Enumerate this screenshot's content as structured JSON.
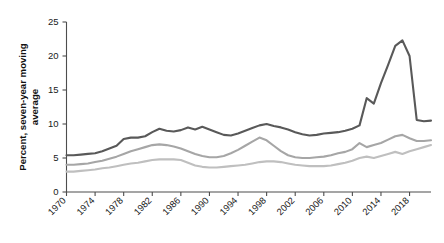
{
  "chart_data": {
    "type": "line",
    "title": "",
    "xlabel": "",
    "ylabel": "Percent, seven-year moving average",
    "ylabel_line1": "Percent, seven-year moving",
    "ylabel_line2": "average",
    "xlim": [
      1970,
      2021
    ],
    "ylim": [
      0,
      25
    ],
    "yticks": [
      0,
      5,
      10,
      15,
      20,
      25
    ],
    "ytick_labels": [
      "0",
      "5",
      "10",
      "15",
      "20",
      "25"
    ],
    "xticks": [
      1970,
      1974,
      1978,
      1982,
      1986,
      1990,
      1994,
      1998,
      2002,
      2006,
      2010,
      2014,
      2018
    ],
    "xtick_labels": [
      "1970",
      "1974",
      "1978",
      "1982",
      "1986",
      "1990",
      "1994",
      "1998",
      "2002",
      "2006",
      "2010",
      "2014",
      "2018"
    ],
    "grid": false,
    "legend": "none",
    "x": [
      1970,
      1971,
      1972,
      1973,
      1974,
      1975,
      1976,
      1977,
      1978,
      1979,
      1980,
      1981,
      1982,
      1983,
      1984,
      1985,
      1986,
      1987,
      1988,
      1989,
      1990,
      1991,
      1992,
      1993,
      1994,
      1995,
      1996,
      1997,
      1998,
      1999,
      2000,
      2001,
      2002,
      2003,
      2004,
      2005,
      2006,
      2007,
      2008,
      2009,
      2010,
      2011,
      2012,
      2013,
      2014,
      2015,
      2016,
      2017,
      2018,
      2019,
      2020,
      2021
    ],
    "series": [
      {
        "name": "series-dark",
        "color": "#595959",
        "width": 2.1,
        "values": [
          5.4,
          5.4,
          5.5,
          5.6,
          5.7,
          6.0,
          6.4,
          6.8,
          7.8,
          8.0,
          8.0,
          8.2,
          8.8,
          9.3,
          9.0,
          8.9,
          9.1,
          9.5,
          9.2,
          9.6,
          9.2,
          8.8,
          8.4,
          8.3,
          8.6,
          9.0,
          9.4,
          9.8,
          10.0,
          9.7,
          9.5,
          9.2,
          8.8,
          8.5,
          8.3,
          8.4,
          8.6,
          8.7,
          8.8,
          9.0,
          9.3,
          9.8,
          13.8,
          13.0,
          16.0,
          18.7,
          21.5,
          22.3,
          20.0,
          10.6,
          10.4,
          10.5
        ]
      },
      {
        "name": "series-medium",
        "color": "#a6a6a6",
        "width": 2.1,
        "values": [
          4.0,
          4.0,
          4.1,
          4.2,
          4.4,
          4.6,
          4.9,
          5.2,
          5.6,
          6.0,
          6.3,
          6.6,
          6.9,
          7.0,
          6.9,
          6.7,
          6.4,
          6.0,
          5.6,
          5.3,
          5.1,
          5.1,
          5.3,
          5.7,
          6.2,
          6.8,
          7.4,
          8.0,
          7.6,
          6.8,
          6.0,
          5.4,
          5.1,
          5.0,
          5.0,
          5.1,
          5.2,
          5.4,
          5.7,
          5.9,
          6.3,
          7.2,
          6.6,
          6.9,
          7.2,
          7.7,
          8.2,
          8.4,
          7.9,
          7.5,
          7.5,
          7.6
        ]
      },
      {
        "name": "series-light",
        "color": "#bfbfbf",
        "width": 2.1,
        "values": [
          3.0,
          3.0,
          3.1,
          3.2,
          3.3,
          3.5,
          3.6,
          3.8,
          4.0,
          4.2,
          4.3,
          4.5,
          4.7,
          4.8,
          4.8,
          4.8,
          4.7,
          4.3,
          3.9,
          3.7,
          3.6,
          3.6,
          3.7,
          3.8,
          3.9,
          4.0,
          4.2,
          4.4,
          4.5,
          4.5,
          4.4,
          4.2,
          4.0,
          3.9,
          3.8,
          3.8,
          3.8,
          3.9,
          4.1,
          4.3,
          4.6,
          5.0,
          5.2,
          5.0,
          5.3,
          5.6,
          5.9,
          5.6,
          6.0,
          6.3,
          6.6,
          6.9
        ]
      }
    ]
  }
}
